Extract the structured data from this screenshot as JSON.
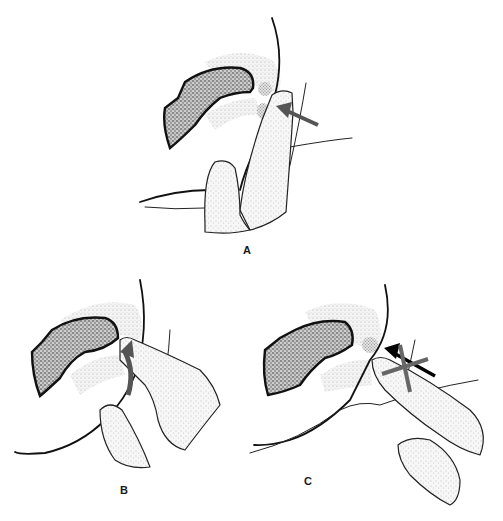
{
  "figure": {
    "panels": [
      {
        "id": "A",
        "label": "A",
        "arrow": "straight pressure arrow toward junction"
      },
      {
        "id": "B",
        "label": "B",
        "arrow": "curved upward arrow beneath fingertip"
      },
      {
        "id": "C",
        "label": "C",
        "arrow": "straight arrow with crossed-out marks (incorrect direction)"
      }
    ],
    "colors": {
      "ink": "#111111",
      "arrow_gray": "#555555",
      "arrow_black": "#000000",
      "background": "#ffffff"
    }
  }
}
